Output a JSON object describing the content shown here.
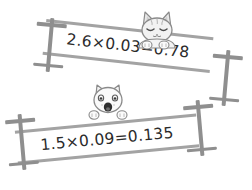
{
  "scene": {
    "title": "Decimal multiplication practice illustration",
    "background_color": "#ffffff",
    "bar_color": "#a3a3a3",
    "post_color": "#8f8f8f",
    "text_color": "#2b2b2b"
  },
  "equations": [
    {
      "id": "equation-top",
      "text": "2.6×0.03=0.78",
      "factor_a": "2.6",
      "factor_b": "0.03",
      "product": "0.78",
      "operator": "×",
      "equals": "="
    },
    {
      "id": "equation-bottom",
      "text": "1.5×0.09=0.135",
      "factor_a": "1.5",
      "factor_b": "0.09",
      "product": "0.135",
      "operator": "×",
      "equals": "="
    }
  ],
  "characters": [
    {
      "id": "cat-top",
      "name": "cat-sleeping-icon",
      "description": "grey striped cat with pointed ears, closed eyes, paws over the bar",
      "expression": "closed-eyes"
    },
    {
      "id": "cat-bottom",
      "name": "cat-surprised-icon",
      "description": "white cat with small ears, open eyes and open mouth peeking over the bar",
      "expression": "open-mouth"
    }
  ]
}
